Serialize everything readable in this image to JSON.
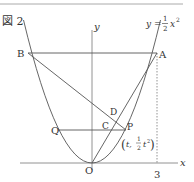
{
  "figure": {
    "caption": "図 2",
    "equation": {
      "lhs": "y =",
      "frac_num": "1",
      "frac_den": "2",
      "rhs": "x",
      "exp": "2"
    },
    "axes": {
      "x_label": "x",
      "y_label": "y",
      "origin_label": "O",
      "x_tick": "3"
    },
    "points": {
      "A": "A",
      "B": "B",
      "C": "C",
      "D": "D",
      "P": "P",
      "Q": "Q"
    },
    "p_coord": {
      "open": "(",
      "t": "t,",
      "num": "1",
      "den": "2",
      "t2": "t",
      "exp": "2",
      "close": ")"
    }
  },
  "colors": {
    "line": "#555555",
    "text": "#333333",
    "rule": "#999999"
  }
}
